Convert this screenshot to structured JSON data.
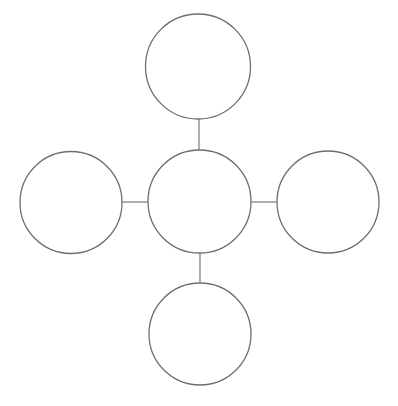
{
  "canvas": {
    "width": 398,
    "height": 406,
    "background_color": "#ffffff"
  },
  "style": {
    "stroke_color": "#6e6e6e",
    "circle_stroke_width": 1.3,
    "connector_stroke_width": 1.1,
    "fill_color": "#ffffff"
  },
  "diagram": {
    "type": "bubble-map",
    "title": "",
    "nodes": [
      {
        "id": "center",
        "role": "center-node",
        "label": "",
        "cx": 199.5,
        "cy": 201.5,
        "r": 51.5
      },
      {
        "id": "top",
        "role": "satellite-node",
        "label": "",
        "cx": 198,
        "cy": 66.5,
        "r": 52.5
      },
      {
        "id": "left",
        "role": "satellite-node",
        "label": "",
        "cx": 71,
        "cy": 202.5,
        "r": 51
      },
      {
        "id": "right",
        "role": "satellite-node",
        "label": "",
        "cx": 328,
        "cy": 202,
        "r": 51
      },
      {
        "id": "bottom",
        "role": "satellite-node",
        "label": "",
        "cx": 200,
        "cy": 334,
        "r": 51
      }
    ],
    "connectors": [
      {
        "id": "center-top",
        "from": "center",
        "to": "top",
        "x1": 199,
        "y1": 150,
        "x2": 199,
        "y2": 119
      },
      {
        "id": "center-left",
        "from": "center",
        "to": "left",
        "x1": 148,
        "y1": 202,
        "x2": 122,
        "y2": 202
      },
      {
        "id": "center-right",
        "from": "center",
        "to": "right",
        "x1": 251,
        "y1": 202,
        "x2": 277,
        "y2": 202
      },
      {
        "id": "center-bottom",
        "from": "center",
        "to": "bottom",
        "x1": 200,
        "y1": 253,
        "x2": 200,
        "y2": 283
      }
    ]
  }
}
